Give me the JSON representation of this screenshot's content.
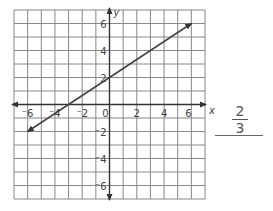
{
  "graph": {
    "x_label": "x",
    "y_label": "y",
    "x_range": [
      -7,
      7
    ],
    "y_range": [
      -7,
      7
    ],
    "x_ticks": [
      "-6",
      "-4",
      "-2",
      "0",
      "2",
      "4",
      "6"
    ],
    "y_ticks": [
      "6",
      "4",
      "2",
      "-2",
      "-4",
      "-6"
    ],
    "line": {
      "from": [
        -6,
        -2
      ],
      "to": [
        6,
        6
      ],
      "y_intercept": 2,
      "x_intercept": -3
    },
    "line_color": "#444444",
    "grid_color": "#888888"
  },
  "answer": {
    "numerator": "2",
    "denominator": "3"
  }
}
